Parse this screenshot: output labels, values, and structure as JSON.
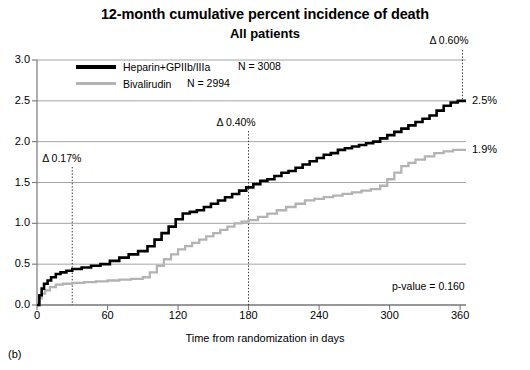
{
  "figure": {
    "title": "12-month cumulative percent incidence of death",
    "subtitle": "All patients",
    "panel_id": "(b)"
  },
  "annotations": {
    "delta_30": "Δ 0.17%",
    "delta_180": "Δ 0.40%",
    "delta_360": "Δ 0.60%",
    "end_black": "2.5%",
    "end_gray": "1.9%",
    "pvalue": "p-value = 0.160"
  },
  "legend": {
    "entries": [
      {
        "label": "Heparin+GPIIb/IIIa",
        "n": "N = 3008",
        "color": "#000000"
      },
      {
        "label": "Bivalirudin",
        "n": "N = 2994",
        "color": "#b3b3b3"
      }
    ]
  },
  "chart_data": {
    "type": "line",
    "title": "12-month cumulative percent incidence of death",
    "subtitle": "All patients",
    "xlabel": "Time from randomization in days",
    "ylabel": "",
    "xlim": [
      0,
      365
    ],
    "ylim": [
      0.0,
      3.0
    ],
    "xticks": [
      0,
      60,
      120,
      180,
      240,
      300,
      360
    ],
    "yticks": [
      "0.0",
      "0.5",
      "1.0",
      "1.5",
      "2.0",
      "2.5",
      "3.0"
    ],
    "grid": "horizontal",
    "legend_position": "top-left",
    "vlines": [
      {
        "x": 30,
        "label": "Δ 0.17%",
        "style": "dotted"
      },
      {
        "x": 180,
        "label": "Δ 0.40%",
        "style": "dotted"
      },
      {
        "x": 362,
        "label": "Δ 0.60%",
        "style": "dotted"
      }
    ],
    "series": [
      {
        "name": "Heparin+GPIIb/IIIa",
        "color": "#000000",
        "n": 3008,
        "final_value": 2.5,
        "end_label": "2.5%",
        "points": [
          [
            0,
            0.0
          ],
          [
            2,
            0.12
          ],
          [
            4,
            0.2
          ],
          [
            6,
            0.26
          ],
          [
            9,
            0.3
          ],
          [
            12,
            0.34
          ],
          [
            16,
            0.38
          ],
          [
            20,
            0.4
          ],
          [
            25,
            0.42
          ],
          [
            30,
            0.44
          ],
          [
            38,
            0.46
          ],
          [
            46,
            0.48
          ],
          [
            54,
            0.5
          ],
          [
            62,
            0.54
          ],
          [
            70,
            0.58
          ],
          [
            78,
            0.62
          ],
          [
            86,
            0.66
          ],
          [
            94,
            0.72
          ],
          [
            100,
            0.8
          ],
          [
            106,
            0.88
          ],
          [
            112,
            0.96
          ],
          [
            118,
            1.05
          ],
          [
            124,
            1.12
          ],
          [
            130,
            1.14
          ],
          [
            136,
            1.16
          ],
          [
            142,
            1.2
          ],
          [
            148,
            1.24
          ],
          [
            154,
            1.28
          ],
          [
            160,
            1.32
          ],
          [
            166,
            1.36
          ],
          [
            172,
            1.4
          ],
          [
            178,
            1.44
          ],
          [
            184,
            1.48
          ],
          [
            190,
            1.52
          ],
          [
            196,
            1.54
          ],
          [
            202,
            1.58
          ],
          [
            208,
            1.62
          ],
          [
            214,
            1.64
          ],
          [
            220,
            1.68
          ],
          [
            226,
            1.72
          ],
          [
            232,
            1.76
          ],
          [
            238,
            1.8
          ],
          [
            244,
            1.84
          ],
          [
            250,
            1.86
          ],
          [
            256,
            1.9
          ],
          [
            262,
            1.92
          ],
          [
            268,
            1.94
          ],
          [
            274,
            1.96
          ],
          [
            280,
            1.98
          ],
          [
            286,
            2.0
          ],
          [
            292,
            2.04
          ],
          [
            298,
            2.08
          ],
          [
            304,
            2.12
          ],
          [
            310,
            2.16
          ],
          [
            316,
            2.2
          ],
          [
            322,
            2.24
          ],
          [
            328,
            2.28
          ],
          [
            334,
            2.32
          ],
          [
            340,
            2.38
          ],
          [
            346,
            2.44
          ],
          [
            352,
            2.48
          ],
          [
            358,
            2.5
          ],
          [
            365,
            2.5
          ]
        ]
      },
      {
        "name": "Bivalirudin",
        "color": "#b3b3b3",
        "n": 2994,
        "final_value": 1.9,
        "end_label": "1.9%",
        "points": [
          [
            0,
            0.0
          ],
          [
            2,
            0.08
          ],
          [
            4,
            0.14
          ],
          [
            7,
            0.18
          ],
          [
            11,
            0.22
          ],
          [
            16,
            0.25
          ],
          [
            22,
            0.26
          ],
          [
            30,
            0.27
          ],
          [
            40,
            0.28
          ],
          [
            50,
            0.29
          ],
          [
            60,
            0.3
          ],
          [
            70,
            0.31
          ],
          [
            80,
            0.32
          ],
          [
            90,
            0.34
          ],
          [
            96,
            0.4
          ],
          [
            102,
            0.48
          ],
          [
            108,
            0.56
          ],
          [
            114,
            0.62
          ],
          [
            120,
            0.68
          ],
          [
            126,
            0.72
          ],
          [
            132,
            0.76
          ],
          [
            138,
            0.8
          ],
          [
            144,
            0.84
          ],
          [
            150,
            0.88
          ],
          [
            156,
            0.92
          ],
          [
            162,
            0.96
          ],
          [
            168,
            1.0
          ],
          [
            174,
            1.02
          ],
          [
            180,
            1.04
          ],
          [
            188,
            1.08
          ],
          [
            196,
            1.12
          ],
          [
            204,
            1.16
          ],
          [
            212,
            1.2
          ],
          [
            220,
            1.24
          ],
          [
            228,
            1.28
          ],
          [
            236,
            1.3
          ],
          [
            244,
            1.32
          ],
          [
            252,
            1.34
          ],
          [
            260,
            1.36
          ],
          [
            268,
            1.38
          ],
          [
            276,
            1.4
          ],
          [
            284,
            1.42
          ],
          [
            292,
            1.46
          ],
          [
            298,
            1.54
          ],
          [
            304,
            1.62
          ],
          [
            310,
            1.7
          ],
          [
            316,
            1.74
          ],
          [
            322,
            1.78
          ],
          [
            330,
            1.82
          ],
          [
            338,
            1.86
          ],
          [
            346,
            1.88
          ],
          [
            354,
            1.9
          ],
          [
            365,
            1.9
          ]
        ]
      }
    ]
  }
}
